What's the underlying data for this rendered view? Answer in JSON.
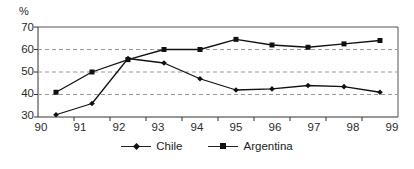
{
  "chart_data": {
    "type": "line",
    "title": "",
    "xlabel": "",
    "ylabel": "%",
    "ylim": [
      30,
      70
    ],
    "yticks": [
      30,
      40,
      50,
      60,
      70
    ],
    "gridlines_dashed": [
      40,
      50,
      60
    ],
    "grid": true,
    "legend_position": "bottom-center",
    "categories": [
      "90",
      "91",
      "92",
      "93",
      "94",
      "95",
      "96",
      "97",
      "98",
      "99"
    ],
    "series": [
      {
        "name": "Chile",
        "marker": "diamond",
        "color": "#111111",
        "values": [
          31,
          36,
          56,
          54,
          47,
          42,
          42.5,
          44,
          43.5,
          41
        ]
      },
      {
        "name": "Argentina",
        "marker": "square",
        "color": "#111111",
        "values": [
          41,
          50,
          55.5,
          60,
          60,
          64.5,
          62,
          61,
          62.5,
          64
        ]
      }
    ]
  },
  "axis": {
    "unit_label": "%",
    "y_tick_labels": [
      "70",
      "60",
      "50",
      "40",
      "30"
    ],
    "x_tick_labels": [
      "90",
      "91",
      "92",
      "93",
      "94",
      "95",
      "96",
      "97",
      "98",
      "99"
    ]
  },
  "legend": {
    "items": [
      {
        "label": "Chile",
        "marker": "diamond-marker"
      },
      {
        "label": "Argentina",
        "marker": "square-marker"
      }
    ]
  },
  "colors": {
    "line": "#222222",
    "marker": "#111111",
    "grid": "#999999",
    "axis": "#555555",
    "text": "#2b2b2b"
  }
}
